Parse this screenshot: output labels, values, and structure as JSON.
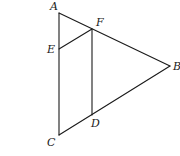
{
  "diagram": {
    "type": "geometry",
    "points": {
      "A": {
        "label": "A",
        "x": 59,
        "y": 13,
        "lx": 50,
        "ly": 10
      },
      "F": {
        "label": "F",
        "x": 92,
        "y": 29,
        "lx": 96,
        "ly": 26
      },
      "E": {
        "label": "E",
        "x": 59,
        "y": 49,
        "lx": 47,
        "ly": 53
      },
      "B": {
        "label": "B",
        "x": 170,
        "y": 66,
        "lx": 173,
        "ly": 70
      },
      "D": {
        "label": "D",
        "x": 92,
        "y": 115,
        "lx": 91,
        "ly": 127
      },
      "C": {
        "label": "C",
        "x": 59,
        "y": 135,
        "lx": 47,
        "ly": 146
      }
    },
    "segments": [
      {
        "from": "A",
        "to": "C"
      },
      {
        "from": "A",
        "to": "B"
      },
      {
        "from": "C",
        "to": "B"
      },
      {
        "from": "E",
        "to": "F"
      },
      {
        "from": "F",
        "to": "D"
      }
    ],
    "labels": [
      "A",
      "F",
      "E",
      "B",
      "D",
      "C"
    ],
    "stroke_color": "#1a1a1a",
    "background": "#ffffff"
  }
}
